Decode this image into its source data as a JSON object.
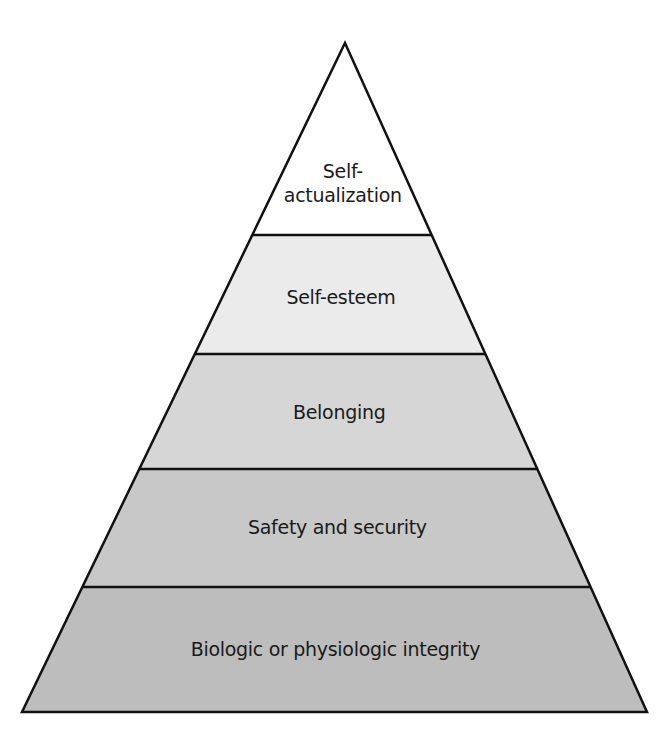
{
  "diagram": {
    "type": "pyramid",
    "outline_color": "#111111",
    "apex": [
      345,
      43
    ],
    "base_left": [
      22,
      712
    ],
    "base_right": [
      647,
      712
    ],
    "levels": [
      {
        "label_line1": "Self-",
        "label_line2": "actualization",
        "fill": "#ffffff",
        "top": 43,
        "bottom": 235,
        "label_y": 183
      },
      {
        "label_line1": "Self-esteem",
        "label_line2": "",
        "fill": "#ebebeb",
        "top": 235,
        "bottom": 354,
        "label_y": 297
      },
      {
        "label_line1": "Belonging",
        "label_line2": "",
        "fill": "#d6d6d6",
        "top": 354,
        "bottom": 469,
        "label_y": 412
      },
      {
        "label_line1": "Safety and security",
        "label_line2": "",
        "fill": "#c8c8c8",
        "top": 469,
        "bottom": 587,
        "label_y": 527
      },
      {
        "label_line1": "Biologic or physiologic integrity",
        "label_line2": "",
        "fill": "#bdbdbd",
        "top": 587,
        "bottom": 712,
        "label_y": 649
      }
    ]
  }
}
